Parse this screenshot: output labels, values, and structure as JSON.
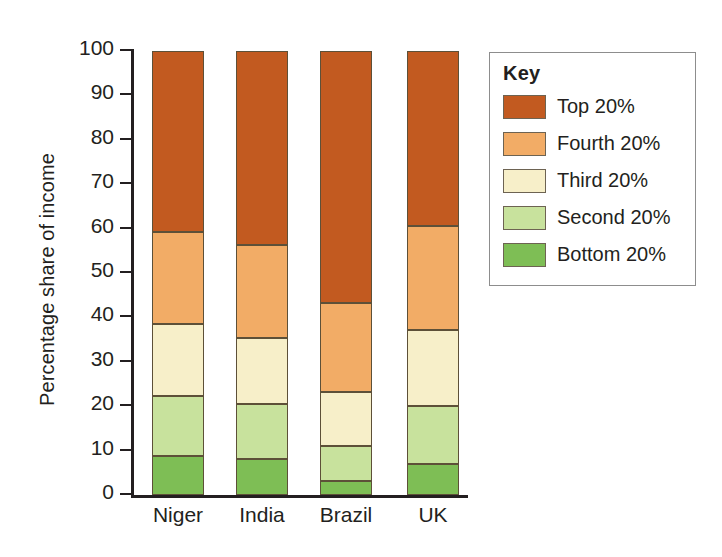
{
  "chart_data": {
    "type": "bar",
    "subtype": "stacked-bar-100-percent",
    "title": "",
    "xlabel": "",
    "ylabel": "Percentage share of income",
    "ylim": [
      0,
      100
    ],
    "yticks": [
      0,
      10,
      20,
      30,
      40,
      50,
      60,
      70,
      80,
      90,
      100
    ],
    "ytick_labels": [
      "0",
      "10",
      "20",
      "30",
      "40",
      "50",
      "60",
      "70",
      "80",
      "90",
      "100"
    ],
    "grid": false,
    "legend_position": "right",
    "legend_title": "Key",
    "categories": [
      "Niger",
      "India",
      "Brazil",
      "UK"
    ],
    "series": [
      {
        "name": "Bottom 20%",
        "color": "#7EBE55",
        "values": [
          8.8,
          8.1,
          3.2,
          7.0
        ]
      },
      {
        "name": "Second 20%",
        "color": "#C8E29D",
        "values": [
          13.4,
          12.3,
          7.8,
          13.0
        ]
      },
      {
        "name": "Third 20%",
        "color": "#F7EFC9",
        "values": [
          16.3,
          14.9,
          12.2,
          17.2
        ]
      },
      {
        "name": "Fourth 20%",
        "color": "#F2AC66",
        "values": [
          20.7,
          21.1,
          20.1,
          23.3
        ]
      },
      {
        "name": "Top 20%",
        "color": "#C25A20",
        "values": [
          40.8,
          43.6,
          56.7,
          39.5
        ]
      }
    ],
    "cumulative_tops": {
      "Niger": [
        8.8,
        22.2,
        38.5,
        59.2,
        100
      ],
      "India": [
        8.1,
        20.4,
        35.3,
        56.4,
        100
      ],
      "Brazil": [
        3.2,
        11.0,
        23.2,
        43.3,
        100
      ],
      "UK": [
        7.0,
        20.0,
        37.2,
        60.5,
        100
      ]
    }
  },
  "axis": {
    "y_title": "Percentage share of income",
    "ticks": [
      {
        "value": 100,
        "label": "100"
      },
      {
        "value": 90,
        "label": "90"
      },
      {
        "value": 80,
        "label": "80"
      },
      {
        "value": 70,
        "label": "70"
      },
      {
        "value": 60,
        "label": "60"
      },
      {
        "value": 50,
        "label": "50"
      },
      {
        "value": 40,
        "label": "40"
      },
      {
        "value": 30,
        "label": "30"
      },
      {
        "value": 20,
        "label": "20"
      },
      {
        "value": 10,
        "label": "10"
      },
      {
        "value": 0,
        "label": "0"
      }
    ]
  },
  "bars": [
    {
      "label": "Niger",
      "segments": [
        {
          "name": "Top 20%",
          "color": "#C25A20",
          "from": 59.2,
          "to": 100
        },
        {
          "name": "Fourth 20%",
          "color": "#F2AC66",
          "from": 38.5,
          "to": 59.2
        },
        {
          "name": "Third 20%",
          "color": "#F7EFC9",
          "from": 22.2,
          "to": 38.5
        },
        {
          "name": "Second 20%",
          "color": "#C8E29D",
          "from": 8.8,
          "to": 22.2
        },
        {
          "name": "Bottom 20%",
          "color": "#7EBE55",
          "from": 0,
          "to": 8.8
        }
      ]
    },
    {
      "label": "India",
      "segments": [
        {
          "name": "Top 20%",
          "color": "#C25A20",
          "from": 56.4,
          "to": 100
        },
        {
          "name": "Fourth 20%",
          "color": "#F2AC66",
          "from": 35.3,
          "to": 56.4
        },
        {
          "name": "Third 20%",
          "color": "#F7EFC9",
          "from": 20.4,
          "to": 35.3
        },
        {
          "name": "Second 20%",
          "color": "#C8E29D",
          "from": 8.1,
          "to": 20.4
        },
        {
          "name": "Bottom 20%",
          "color": "#7EBE55",
          "from": 0,
          "to": 8.1
        }
      ]
    },
    {
      "label": "Brazil",
      "segments": [
        {
          "name": "Top 20%",
          "color": "#C25A20",
          "from": 43.3,
          "to": 100
        },
        {
          "name": "Fourth 20%",
          "color": "#F2AC66",
          "from": 23.2,
          "to": 43.3
        },
        {
          "name": "Third 20%",
          "color": "#F7EFC9",
          "from": 11.0,
          "to": 23.2
        },
        {
          "name": "Second 20%",
          "color": "#C8E29D",
          "from": 3.2,
          "to": 11.0
        },
        {
          "name": "Bottom 20%",
          "color": "#7EBE55",
          "from": 0,
          "to": 3.2
        }
      ]
    },
    {
      "label": "UK",
      "segments": [
        {
          "name": "Top 20%",
          "color": "#C25A20",
          "from": 60.5,
          "to": 100
        },
        {
          "name": "Fourth 20%",
          "color": "#F2AC66",
          "from": 37.2,
          "to": 60.5
        },
        {
          "name": "Third 20%",
          "color": "#F7EFC9",
          "from": 20.0,
          "to": 37.2
        },
        {
          "name": "Second 20%",
          "color": "#C8E29D",
          "from": 7.0,
          "to": 20.0
        },
        {
          "name": "Bottom 20%",
          "color": "#7EBE55",
          "from": 0,
          "to": 7.0
        }
      ]
    }
  ],
  "legend": {
    "title": "Key",
    "items": [
      {
        "label": "Top 20%",
        "color": "#C25A20"
      },
      {
        "label": "Fourth 20%",
        "color": "#F2AC66"
      },
      {
        "label": "Third 20%",
        "color": "#F7EFC9"
      },
      {
        "label": "Second 20%",
        "color": "#C8E29D"
      },
      {
        "label": "Bottom 20%",
        "color": "#7EBE55"
      }
    ]
  }
}
